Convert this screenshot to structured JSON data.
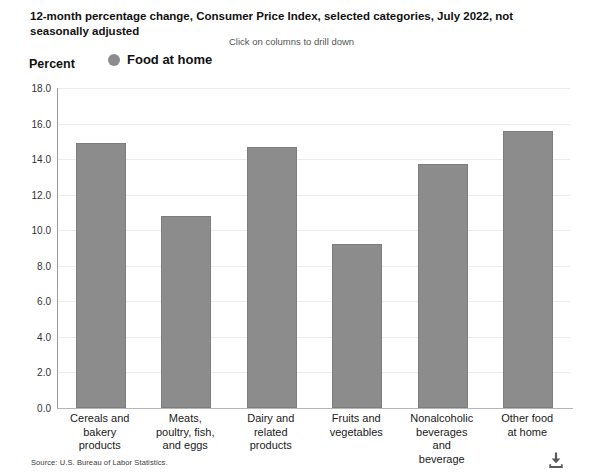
{
  "header": {
    "title": "12-month percentage change, Consumer Price Index, selected categories, July 2022, not seasonally adjusted",
    "drill_hint": "Click on columns to drill down",
    "y_axis_title": "Percent"
  },
  "legend": {
    "items": [
      {
        "label": "Food at home",
        "color": "#8c8c8c",
        "marker": "circle"
      }
    ]
  },
  "footer": {
    "source": "Source: U.S. Bureau of Labor Statistics.",
    "download_icon": "download-icon"
  },
  "colors": {
    "bar_fill": "#8c8c8c",
    "bar_stroke": "#7d7d7d",
    "gridline": "#ececec",
    "axis": "#9a9a9a"
  },
  "chart_data": {
    "type": "bar",
    "title": "12-month percentage change, Consumer Price Index, selected categories, July 2022, not seasonally adjusted",
    "xlabel": "",
    "ylabel": "Percent",
    "ylim": [
      0.0,
      18.0
    ],
    "yticks": [
      "0.0",
      "2.0",
      "4.0",
      "6.0",
      "8.0",
      "10.0",
      "12.0",
      "14.0",
      "16.0",
      "18.0"
    ],
    "ytick_values": [
      0.0,
      2.0,
      4.0,
      6.0,
      8.0,
      10.0,
      12.0,
      14.0,
      16.0,
      18.0
    ],
    "grid": true,
    "legend_position": "top",
    "categories": [
      "Cereals and bakery products",
      "Meats, poultry, fish, and eggs",
      "Dairy and related products",
      "Fruits and vegetables",
      "Nonalcoholic beverages and beverage",
      "Other food at home"
    ],
    "category_lines": [
      [
        "Cereals and",
        "bakery",
        "products"
      ],
      [
        "Meats,",
        "poultry, fish,",
        "and eggs"
      ],
      [
        "Dairy and",
        "related",
        "products"
      ],
      [
        "Fruits and",
        "vegetables"
      ],
      [
        "Nonalcoholic",
        "beverages",
        "and",
        "beverage"
      ],
      [
        "Other food",
        "at home"
      ]
    ],
    "series": [
      {
        "name": "Food at home",
        "color": "#8c8c8c",
        "values": [
          14.9,
          10.8,
          14.7,
          9.2,
          13.7,
          15.6
        ]
      }
    ]
  }
}
